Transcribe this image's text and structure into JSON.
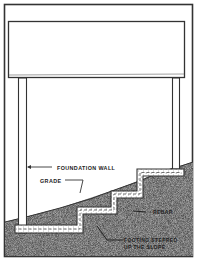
{
  "diagram": {
    "type": "cross-section",
    "labels": {
      "foundation_wall": "FOUNDATION WALL",
      "grade": "GRADE",
      "rebar": "REBAR",
      "footing_line1": "FOOTING STEPPED",
      "footing_line2": "UP THE SLOPE"
    },
    "colors": {
      "line": "#333333",
      "earth": "#9a9a9a",
      "concrete": "#ffffff",
      "background": "#ffffff"
    }
  }
}
